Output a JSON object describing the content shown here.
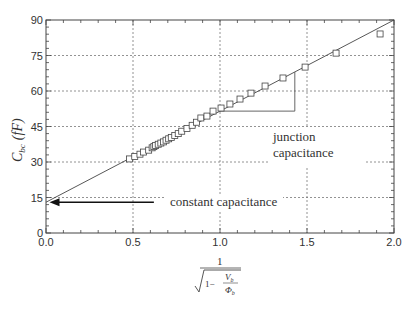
{
  "chart_data": {
    "type": "scatter",
    "title": "",
    "xlabel": "1 / sqrt(1 - V_b / Φ_b)",
    "xlabel_parts": {
      "numerator": "1",
      "one_minus": "1−",
      "V": "V",
      "V_sub": "b",
      "Phi": "Φ",
      "Phi_sub": "b"
    },
    "ylabel": "C_bc (fF)",
    "ylabel_parts": {
      "C": "C",
      "sub": "bc",
      "unit": "(fF)"
    },
    "xlim": [
      0.0,
      2.0
    ],
    "ylim": [
      0,
      90
    ],
    "x_ticks": [
      "0.0",
      "0.5",
      "1.0",
      "1.5",
      "2.0"
    ],
    "y_ticks": [
      "0",
      "15",
      "30",
      "45",
      "60",
      "75",
      "90"
    ],
    "grid": true,
    "series": [
      {
        "name": "measured",
        "marker": "open-square",
        "x": [
          0.48,
          0.51,
          0.54,
          0.56,
          0.59,
          0.61,
          0.62,
          0.63,
          0.645,
          0.66,
          0.675,
          0.69,
          0.705,
          0.72,
          0.74,
          0.76,
          0.78,
          0.81,
          0.84,
          0.865,
          0.89,
          0.925,
          0.96,
          1.006,
          1.057,
          1.115,
          1.178,
          1.259,
          1.362,
          1.489,
          1.667,
          1.92
        ],
        "y": [
          31.3,
          32.3,
          33.3,
          34.2,
          35.0,
          36.0,
          36.5,
          37.0,
          37.5,
          38.0,
          38.5,
          39.2,
          39.8,
          40.4,
          41.2,
          42.0,
          43.0,
          44.2,
          45.5,
          46.8,
          48.6,
          49.4,
          51.5,
          52.8,
          54.5,
          56.6,
          59.1,
          62.1,
          65.5,
          70.1,
          76.0,
          84.1
        ]
      },
      {
        "name": "linear fit",
        "type": "line",
        "x": [
          0.0,
          2.0
        ],
        "y": [
          13.0,
          90.0
        ]
      }
    ],
    "slope_triangle": {
      "x_start": 1.0,
      "x_end": 1.43,
      "y_base": 51.5,
      "y_top": 68.0
    },
    "annotations": [
      {
        "text": "junction capacitance",
        "lines": [
          "junction",
          "capacitance"
        ],
        "x": 1.52,
        "y": 38
      },
      {
        "text": "constant capacitance",
        "x": 0.88,
        "y": 13,
        "arrow_from": [
          0.62,
          13
        ],
        "arrow_to": [
          0.02,
          13
        ]
      }
    ]
  },
  "annotations": {
    "junction_line1": "junction",
    "junction_line2": "capacitance",
    "constant": "constant capacitance"
  }
}
